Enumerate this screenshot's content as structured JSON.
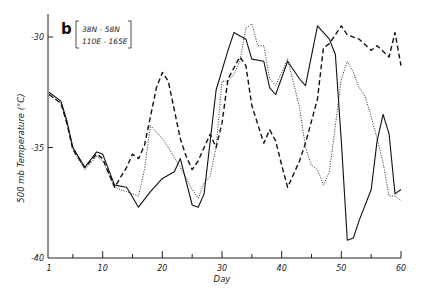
{
  "chart_data": {
    "type": "line",
    "title": "",
    "panel_label": "b",
    "region": [
      "38N - 58N",
      "110E - 165E"
    ],
    "xlabel": "Day",
    "ylabel": "500 mb Temperature (°C)",
    "xlim": [
      1,
      60
    ],
    "ylim": [
      -40,
      -29
    ],
    "xticks": [
      1,
      10,
      20,
      30,
      40,
      50,
      60
    ],
    "xminor_ticks": [
      5,
      15,
      25,
      35,
      45,
      55
    ],
    "yticks": [
      -30,
      -35,
      -40
    ],
    "grid": false,
    "legend": "none",
    "series": [
      {
        "name": "solid",
        "style": "solid",
        "x": [
          1,
          3,
          4,
          5,
          7,
          9,
          10,
          12,
          14,
          16,
          18,
          20,
          22,
          23,
          25,
          26,
          27,
          29,
          31,
          32,
          34,
          35,
          37,
          38,
          39,
          41,
          43,
          44,
          46,
          48,
          49,
          50,
          51,
          52,
          53,
          55,
          56,
          57,
          58,
          59,
          60
        ],
        "values": [
          -32.5,
          -32.9,
          -33.8,
          -35.0,
          -35.9,
          -35.2,
          -35.3,
          -36.7,
          -36.8,
          -37.7,
          -37.0,
          -36.4,
          -36.1,
          -35.5,
          -37.6,
          -37.7,
          -37.1,
          -32.4,
          -30.6,
          -29.8,
          -30.1,
          -31.0,
          -31.1,
          -32.3,
          -32.6,
          -31.1,
          -31.9,
          -32.2,
          -29.5,
          -30.1,
          -30.8,
          -34.7,
          -39.2,
          -39.1,
          -38.3,
          -36.9,
          -34.7,
          -33.5,
          -34.4,
          -37.1,
          -36.9
        ]
      },
      {
        "name": "dashed",
        "style": "dashed",
        "x": [
          1,
          3,
          4,
          5,
          7,
          9,
          10,
          12,
          14,
          15,
          16,
          17,
          19,
          20,
          21,
          23,
          24,
          25,
          26,
          27,
          28,
          29,
          30,
          31,
          33,
          34,
          35,
          37,
          38,
          39,
          40,
          41,
          43,
          44,
          46,
          47,
          48,
          50,
          51,
          53,
          55,
          56,
          58,
          59,
          60
        ],
        "values": [
          -32.6,
          -33.0,
          -33.9,
          -35.1,
          -35.9,
          -35.3,
          -35.5,
          -36.8,
          -35.9,
          -35.3,
          -35.5,
          -34.9,
          -32.3,
          -31.6,
          -32.0,
          -34.6,
          -35.4,
          -36.0,
          -35.6,
          -35.0,
          -34.4,
          -35.0,
          -33.9,
          -31.9,
          -30.9,
          -31.3,
          -33.1,
          -34.8,
          -34.2,
          -34.7,
          -35.8,
          -36.8,
          -35.6,
          -34.8,
          -32.8,
          -30.5,
          -30.3,
          -29.5,
          -29.9,
          -30.1,
          -30.6,
          -30.4,
          -30.9,
          -29.8,
          -31.3
        ]
      },
      {
        "name": "dotted",
        "style": "dotted",
        "x": [
          1,
          3,
          4,
          5,
          7,
          9,
          10,
          12,
          14,
          16,
          17,
          18,
          19,
          20,
          21,
          23,
          24,
          25,
          26,
          27,
          28,
          29,
          30,
          31,
          32,
          33,
          34,
          35,
          36,
          37,
          38,
          39,
          40,
          41,
          42,
          43,
          44,
          45,
          46,
          47,
          48,
          49,
          50,
          51,
          52,
          53,
          54,
          55,
          56,
          57,
          58,
          59,
          60
        ],
        "values": [
          -32.6,
          -33.0,
          -33.9,
          -35.1,
          -36.0,
          -35.4,
          -35.6,
          -36.8,
          -37.0,
          -37.2,
          -36.0,
          -34.0,
          -34.3,
          -34.6,
          -35.0,
          -35.9,
          -36.4,
          -36.9,
          -37.3,
          -36.6,
          -36.3,
          -35.0,
          -32.0,
          -32.0,
          -31.7,
          -31.1,
          -29.6,
          -29.4,
          -30.4,
          -30.4,
          -31.9,
          -32.2,
          -31.6,
          -31.0,
          -32.1,
          -33.2,
          -35.0,
          -35.8,
          -36.0,
          -36.7,
          -36.1,
          -34.0,
          -31.9,
          -31.1,
          -31.6,
          -32.3,
          -32.7,
          -33.6,
          -34.6,
          -35.7,
          -37.2,
          -37.2,
          -37.4
        ]
      }
    ]
  }
}
